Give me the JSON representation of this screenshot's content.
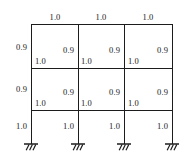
{
  "diagram": {
    "line_color": "#1c1c1c",
    "background_color": "#ffffff",
    "beam_labels": {
      "top_span_1": "1.0",
      "top_span_2": "1.0",
      "top_span_3": "1.0",
      "level2_span_1": "1.0",
      "level2_span_2": "1.0",
      "level2_span_3": "1.0",
      "level3_span_1": "1.0",
      "level3_span_2": "1.0",
      "level3_span_3": "1.0"
    },
    "column_labels": {
      "story3_col_1": "0.9",
      "story3_col_2": "0.9",
      "story3_col_3": "0.9",
      "story3_col_4": "0.9",
      "story2_col_1": "0.9",
      "story2_col_2": "0.9",
      "story2_col_3": "0.9",
      "story2_col_4": "0.9",
      "story1_col_1": "1.0",
      "story1_col_2": "1.0",
      "story1_col_3": "1.0",
      "story1_col_4": "1.0"
    },
    "supports": {
      "type": "fixed",
      "count": 4
    },
    "geometry": {
      "column_x": [
        31,
        78,
        124,
        172
      ],
      "level_y": [
        24,
        68,
        110,
        144
      ],
      "stories": 3,
      "bays": 3
    }
  }
}
